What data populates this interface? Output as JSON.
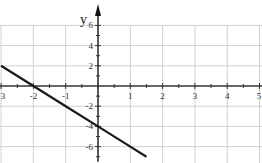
{
  "chart_data": {
    "type": "line",
    "title": "",
    "xlabel": "",
    "ylabel": "y",
    "xlim": [
      -3,
      5
    ],
    "ylim": [
      -7,
      7
    ],
    "x_ticks": [
      -3,
      -2,
      -1,
      0,
      1,
      2,
      3,
      4,
      5
    ],
    "x_tick_labels": [
      "3",
      "-2",
      "-1",
      "",
      "1",
      "2",
      "3",
      "4",
      "5"
    ],
    "y_ticks": [
      -6,
      -4,
      -2,
      2,
      4,
      6
    ],
    "y_tick_labels": [
      "-6",
      "-4",
      "-2",
      "2",
      "4",
      "6"
    ],
    "grid": true,
    "series": [
      {
        "name": "y = -2x - 4",
        "x": [
          -3,
          -2,
          -1,
          0,
          1,
          1.5
        ],
        "values": [
          2,
          0,
          -2,
          -4,
          -6,
          -7
        ]
      }
    ],
    "colors": {
      "line": "#1a1a1a",
      "grid": "#d0d0d0",
      "axis": "#333333"
    }
  }
}
